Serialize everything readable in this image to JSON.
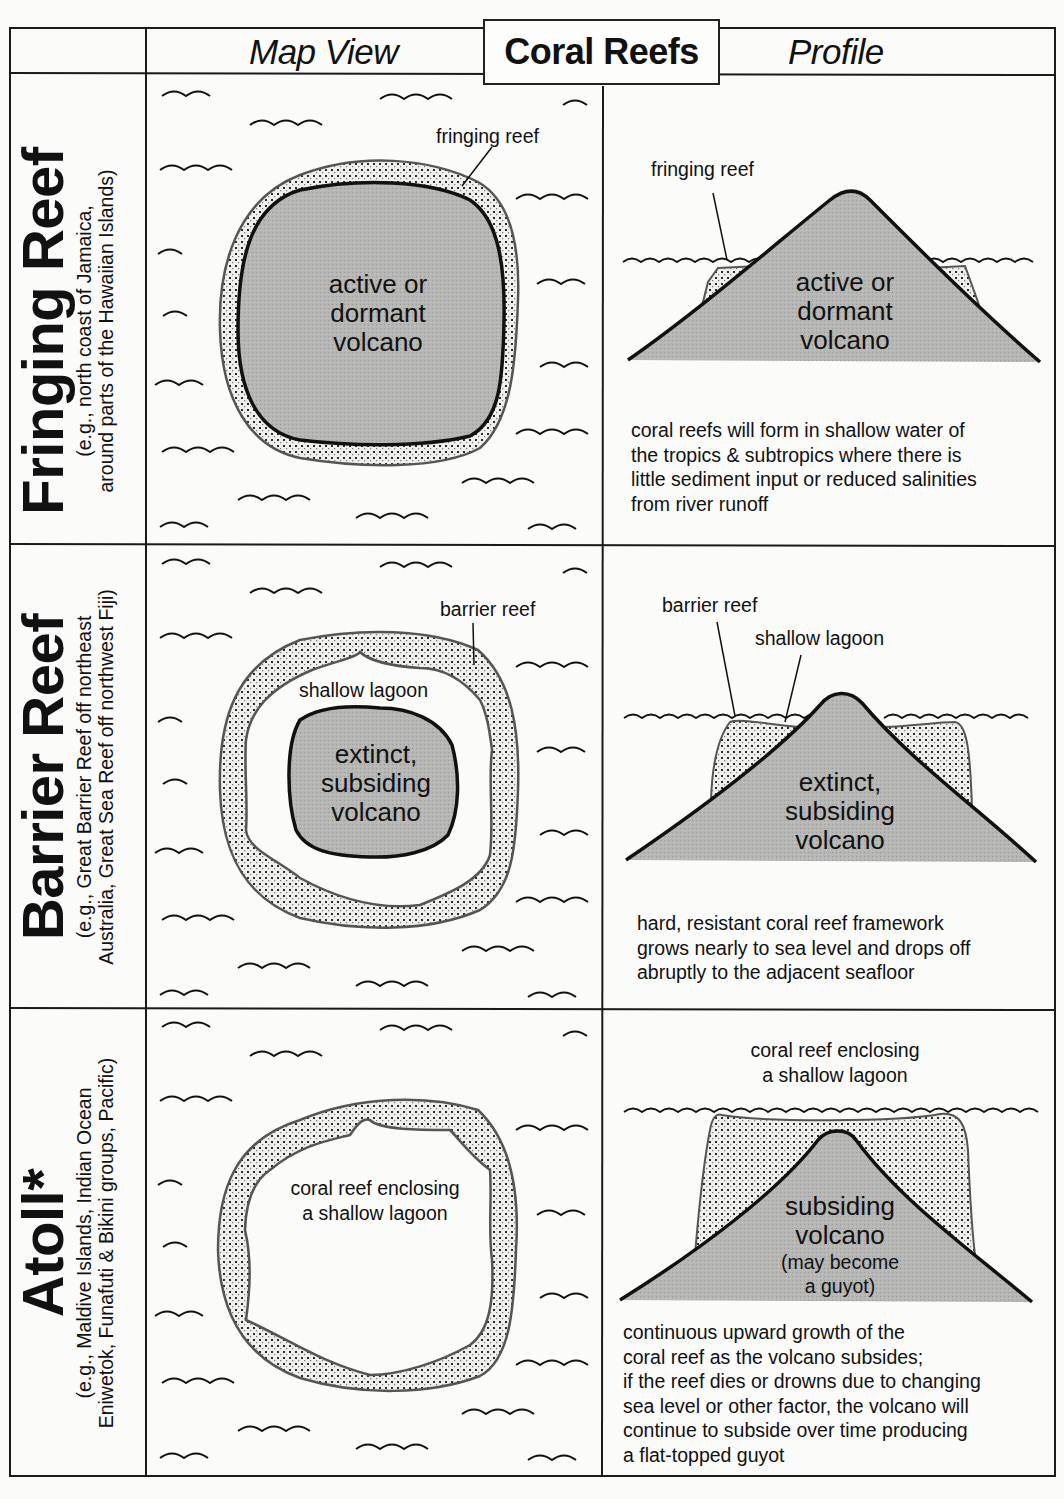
{
  "title": "Coral Reefs",
  "columns": {
    "map_view": "Map View",
    "profile": "Profile"
  },
  "colors": {
    "volcano_fill": "#b4b4b4",
    "reef_fill": "#ececea",
    "reef_dots": "#2a2a2a",
    "line": "#111111",
    "background": "#fbfbfa"
  },
  "rows": [
    {
      "name": "Fringing Reef",
      "examples_line1": "(e.g., north coast of Jamaica,",
      "examples_line2": "around parts of the Hawaiian Islands)",
      "map": {
        "reef_label": "fringing reef",
        "center_line1": "active or",
        "center_line2": "dormant",
        "center_line3": "volcano"
      },
      "profile": {
        "reef_label": "fringing reef",
        "center_line1": "active or",
        "center_line2": "dormant",
        "center_line3": "volcano",
        "note_lines": [
          "coral reefs will form in shallow water of",
          "the tropics & subtropics where there is",
          "little sediment input or reduced salinities",
          "from river runoff"
        ]
      }
    },
    {
      "name": "Barrier Reef",
      "examples_line1": "(e.g., Great Barrier Reef off northeast",
      "examples_line2": "Australia, Great Sea Reef off northwest Fiji)",
      "map": {
        "reef_label": "barrier reef",
        "lagoon_label": "shallow lagoon",
        "center_line1": "extinct,",
        "center_line2": "subsiding",
        "center_line3": "volcano"
      },
      "profile": {
        "reef_label": "barrier reef",
        "lagoon_label": "shallow lagoon",
        "center_line1": "extinct,",
        "center_line2": "subsiding",
        "center_line3": "volcano",
        "note_lines": [
          "hard, resistant coral reef framework",
          "grows nearly to sea level and drops off",
          "abruptly to the adjacent seafloor"
        ]
      }
    },
    {
      "name": "Atoll*",
      "examples_line1": "(e.g., Maldive Islands, Indian Ocean",
      "examples_line2": "Eniwetok, Funafuti & Bikini groups, Pacific)",
      "map": {
        "center_line1": "coral reef enclosing",
        "center_line2": "a shallow lagoon"
      },
      "profile": {
        "top_line1": "coral reef enclosing",
        "top_line2": "a shallow lagoon",
        "center_line1": "subsiding",
        "center_line2": "volcano",
        "center_line3": "(may become",
        "center_line4": "a guyot)",
        "note_lines": [
          "continuous upward growth of the",
          "coral reef as the volcano subsides;",
          "if the reef dies or drowns due to changing",
          "sea level or other factor, the volcano will",
          "continue to subside over time producing",
          "a flat-topped guyot"
        ]
      }
    }
  ]
}
